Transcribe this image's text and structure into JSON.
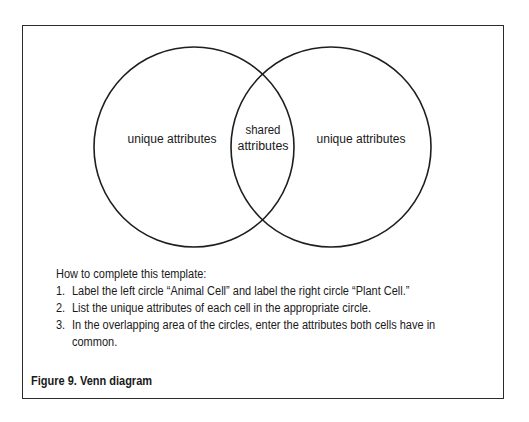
{
  "diagram": {
    "type": "venn",
    "circles": [
      {
        "id": "left",
        "label": "unique attributes",
        "cx": 194,
        "cy": 147,
        "r": 100
      },
      {
        "id": "right",
        "label": "unique attributes",
        "cx": 331,
        "cy": 147,
        "r": 100
      }
    ],
    "overlap": {
      "label_line1": "shared",
      "label_line2": "attributes"
    },
    "stroke_color": "#1e1e1e",
    "border_color": "#2b2b2b"
  },
  "instructions": {
    "heading": "How to complete this template:",
    "steps": [
      {
        "number": "1.",
        "text": "Label the left circle “Animal Cell” and label the right circle “Plant Cell.”"
      },
      {
        "number": "2.",
        "text": "List the unique attributes of each cell in the appropriate circle."
      },
      {
        "number": "3.",
        "text": "In the overlapping area of the circles, enter the attributes both cells have in",
        "continuation": "common."
      }
    ]
  },
  "caption": "Figure 9. Venn diagram"
}
